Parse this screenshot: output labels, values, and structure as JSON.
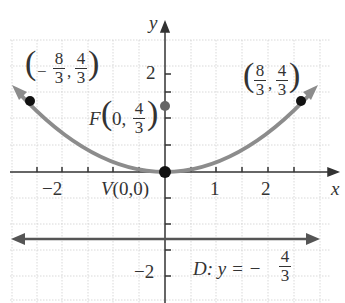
{
  "figure": {
    "axes": {
      "x_label": "x",
      "y_label": "y",
      "x_ticks": [
        "-2",
        "1",
        "2"
      ],
      "y_ticks": [
        "2",
        "-2"
      ]
    },
    "curve": {
      "equation": "parabola x^2 = (16/3) y",
      "color": "#8c8c8c"
    },
    "points": {
      "left": {
        "label": "(-8/3, 4/3)",
        "x": -2.667,
        "y": 1.333
      },
      "right": {
        "label": "(8/3, 4/3)",
        "x": 2.667,
        "y": 1.333
      },
      "focus": {
        "label": "F(0, 4/3)",
        "x": 0,
        "y": 1.333
      },
      "vertex": {
        "label": "V(0,0)",
        "x": 0,
        "y": 0
      }
    },
    "directrix": {
      "label": "D: y = -4/3",
      "y": -1.333
    },
    "labels": {
      "left_num1": "8",
      "left_den": "3",
      "left_num2": "4",
      "right_num1": "8",
      "right_num2": "4",
      "den": "3",
      "focus_prefix": "F",
      "focus_zero": "0,",
      "focus_num": "4",
      "vertex": "V(0,0)",
      "dir_prefix": "D: y = −",
      "dir_num": "4",
      "x_axis": "x",
      "y_axis": "y",
      "tick_m2": "−2",
      "tick_1": "1",
      "tick_2": "2",
      "ytick_2": "2",
      "ytick_m2": "−2"
    }
  }
}
